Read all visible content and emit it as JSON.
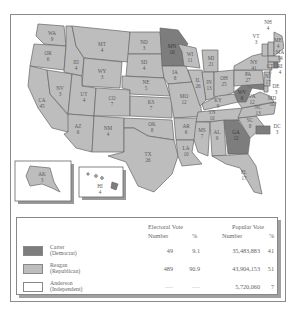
{
  "map": {
    "title": "1980 Presidential Election",
    "colors": {
      "carter": "#7d7d7d",
      "reagan": "#bdbdbd",
      "anderson": "#ffffff"
    },
    "states": [
      {
        "abbr": "WA",
        "ev": "9",
        "winner": "reagan"
      },
      {
        "abbr": "OR",
        "ev": "6",
        "winner": "reagan"
      },
      {
        "abbr": "CA",
        "ev": "45",
        "winner": "reagan"
      },
      {
        "abbr": "NV",
        "ev": "3",
        "winner": "reagan"
      },
      {
        "abbr": "ID",
        "ev": "4",
        "winner": "reagan"
      },
      {
        "abbr": "MT",
        "ev": "4",
        "winner": "reagan"
      },
      {
        "abbr": "WY",
        "ev": "3",
        "winner": "reagan"
      },
      {
        "abbr": "UT",
        "ev": "4",
        "winner": "reagan"
      },
      {
        "abbr": "CO",
        "ev": "7",
        "winner": "reagan"
      },
      {
        "abbr": "AZ",
        "ev": "6",
        "winner": "reagan"
      },
      {
        "abbr": "NM",
        "ev": "4",
        "winner": "reagan"
      },
      {
        "abbr": "ND",
        "ev": "3",
        "winner": "reagan"
      },
      {
        "abbr": "SD",
        "ev": "4",
        "winner": "reagan"
      },
      {
        "abbr": "NE",
        "ev": "5",
        "winner": "reagan"
      },
      {
        "abbr": "KS",
        "ev": "7",
        "winner": "reagan"
      },
      {
        "abbr": "OK",
        "ev": "8",
        "winner": "reagan"
      },
      {
        "abbr": "TX",
        "ev": "26",
        "winner": "reagan"
      },
      {
        "abbr": "MN",
        "ev": "10",
        "winner": "carter"
      },
      {
        "abbr": "IA",
        "ev": "8",
        "winner": "reagan"
      },
      {
        "abbr": "MO",
        "ev": "12",
        "winner": "reagan"
      },
      {
        "abbr": "AR",
        "ev": "6",
        "winner": "reagan"
      },
      {
        "abbr": "LA",
        "ev": "10",
        "winner": "reagan"
      },
      {
        "abbr": "WI",
        "ev": "11",
        "winner": "reagan"
      },
      {
        "abbr": "IL",
        "ev": "26",
        "winner": "reagan"
      },
      {
        "abbr": "MI",
        "ev": "21",
        "winner": "reagan"
      },
      {
        "abbr": "IN",
        "ev": "13",
        "winner": "reagan"
      },
      {
        "abbr": "OH",
        "ev": "25",
        "winner": "reagan"
      },
      {
        "abbr": "KY",
        "ev": "9",
        "winner": "reagan"
      },
      {
        "abbr": "TN",
        "ev": "10",
        "winner": "reagan"
      },
      {
        "abbr": "MS",
        "ev": "7",
        "winner": "reagan"
      },
      {
        "abbr": "AL",
        "ev": "9",
        "winner": "reagan"
      },
      {
        "abbr": "GA",
        "ev": "12",
        "winner": "carter"
      },
      {
        "abbr": "FL",
        "ev": "17",
        "winner": "reagan"
      },
      {
        "abbr": "SC",
        "ev": "8",
        "winner": "reagan"
      },
      {
        "abbr": "NC",
        "ev": "13",
        "winner": "reagan"
      },
      {
        "abbr": "VA",
        "ev": "12",
        "winner": "reagan"
      },
      {
        "abbr": "WV",
        "ev": "6",
        "winner": "carter"
      },
      {
        "abbr": "PA",
        "ev": "27",
        "winner": "reagan"
      },
      {
        "abbr": "NY",
        "ev": "41",
        "winner": "reagan"
      },
      {
        "abbr": "VT",
        "ev": "3",
        "winner": "reagan"
      },
      {
        "abbr": "NH",
        "ev": "4",
        "winner": "reagan"
      },
      {
        "abbr": "ME",
        "ev": "4",
        "winner": "reagan"
      },
      {
        "abbr": "MA",
        "ev": "14",
        "winner": "reagan"
      },
      {
        "abbr": "RI",
        "ev": "4",
        "winner": "carter"
      },
      {
        "abbr": "CT",
        "ev": "8",
        "winner": "reagan"
      },
      {
        "abbr": "NJ",
        "ev": "17",
        "winner": "reagan"
      },
      {
        "abbr": "DE",
        "ev": "3",
        "winner": "reagan"
      },
      {
        "abbr": "MD",
        "ev": "10",
        "winner": "carter"
      },
      {
        "abbr": "DC",
        "ev": "3",
        "winner": "carter"
      },
      {
        "abbr": "AK",
        "ev": "3",
        "winner": "reagan"
      },
      {
        "abbr": "HI",
        "ev": "4",
        "winner": "carter"
      }
    ]
  },
  "table": {
    "headers": {
      "electoral": "Electoral Vote",
      "popular": "Popular Vote",
      "number": "Number",
      "pct": "%"
    },
    "rows": [
      {
        "candidate": "Carter",
        "party": "(Democrat)",
        "ev_number": "49",
        "ev_pct": "9.1",
        "pop_number": "35,483,883",
        "pop_pct": "41",
        "color": "#7d7d7d"
      },
      {
        "candidate": "Reagan",
        "party": "(Republican)",
        "ev_number": "489",
        "ev_pct": "90.9",
        "pop_number": "43,904,153",
        "pop_pct": "51",
        "color": "#bdbdbd"
      },
      {
        "candidate": "Anderson",
        "party": "(Independent)",
        "ev_number": "----",
        "ev_pct": "----",
        "pop_number": "5,720,060",
        "pop_pct": "7",
        "color": "#ffffff"
      }
    ]
  }
}
